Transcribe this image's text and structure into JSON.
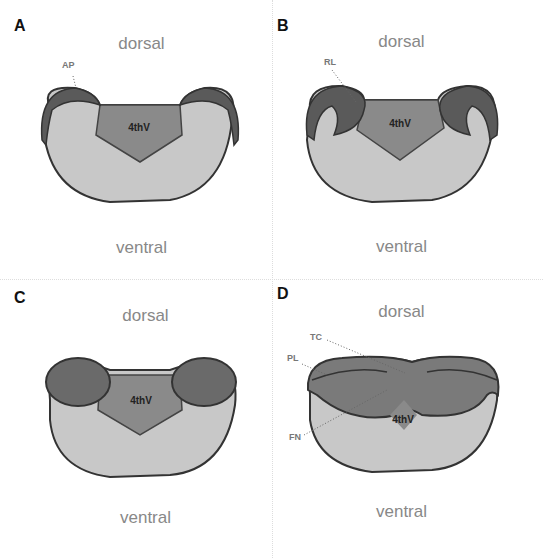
{
  "panels": [
    {
      "letter": "A",
      "dorsal": "dorsal",
      "ventral": "ventral",
      "ventricle": "4thV",
      "annotations": [
        "AP"
      ]
    },
    {
      "letter": "B",
      "dorsal": "dorsal",
      "ventral": "ventral",
      "ventricle": "4thV",
      "annotations": [
        "RL"
      ]
    },
    {
      "letter": "C",
      "dorsal": "dorsal",
      "ventral": "ventral",
      "ventricle": "4thV",
      "annotations": []
    },
    {
      "letter": "D",
      "dorsal": "dorsal",
      "ventral": "ventral",
      "ventricle": "4thV",
      "annotations": [
        "TC",
        "PL",
        "FN"
      ]
    }
  ],
  "colors": {
    "body": "#c8c8c8",
    "ventricle": "#8a8a8a",
    "lip": "#5a5a5a",
    "outline": "#333333",
    "label": "#888888"
  }
}
